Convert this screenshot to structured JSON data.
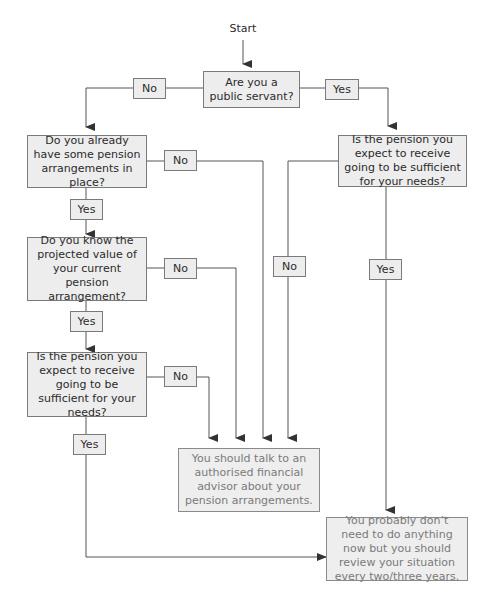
{
  "diagram": {
    "start_label": "Start",
    "nodes": {
      "q_public_servant": "Are you a public servant?",
      "q_existing_arrangements": "Do you already have some pension arrangements in place?",
      "q_projected_value": "Do you know the projected value of your current pension arrangement?",
      "q_sufficient_left": "Is the pension you expect to receive going to be sufficient for your needs?",
      "q_sufficient_right": "Is the pension you expect to receive going to be sufficient for your needs?",
      "r_talk_advisor": "You should talk to an authorised financial advisor about your pension arrangements.",
      "r_no_action": "You probably don’t need to do anything now but you should review your situation every two/three years."
    },
    "edge_labels": {
      "public_no": "No",
      "public_yes": "Yes",
      "existing_no": "No",
      "existing_yes": "Yes",
      "projected_no": "No",
      "projected_yes": "Yes",
      "sufficient_left_no": "No",
      "sufficient_left_yes": "Yes",
      "sufficient_right_no": "No",
      "sufficient_right_yes": "Yes"
    },
    "colors": {
      "box_fill": "#ededed",
      "box_border": "#7a7a7a",
      "line": "#555555",
      "result_text": "#7a7a7a"
    }
  }
}
